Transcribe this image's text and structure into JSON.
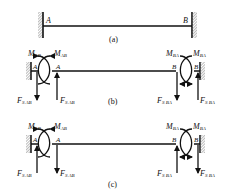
{
  "figure": {
    "panels": [
      {
        "id": "a",
        "caption": "(a)",
        "label_left": "A",
        "label_right": "B"
      },
      {
        "id": "b",
        "caption": "(b)",
        "label_left": "A",
        "label_right": "B",
        "moment_left": {
          "M": "M",
          "sub": "AB"
        },
        "moment_right": {
          "M": "M",
          "sub": "BA"
        },
        "shear_left": {
          "F": "F",
          "sub": "S AB"
        },
        "shear_right": {
          "F": "F",
          "sub": "S BA"
        },
        "shear_direction_at_wall_left": "down",
        "shear_direction_at_beam_left": "up",
        "shear_direction_at_beam_right": "down",
        "shear_direction_at_wall_right": "up"
      },
      {
        "id": "c",
        "caption": "(c)",
        "label_left": "A",
        "label_right": "B",
        "moment_left": {
          "M": "M",
          "sub": "AB"
        },
        "moment_right": {
          "M": "M",
          "sub": "BA"
        },
        "shear_left": {
          "F": "F",
          "sub": "S AB"
        },
        "shear_right": {
          "F": "F",
          "sub": "S BA"
        },
        "shear_direction_at_wall_left": "up",
        "shear_direction_at_beam_left": "down",
        "shear_direction_at_beam_right": "up",
        "shear_direction_at_wall_right": "down"
      }
    ]
  }
}
